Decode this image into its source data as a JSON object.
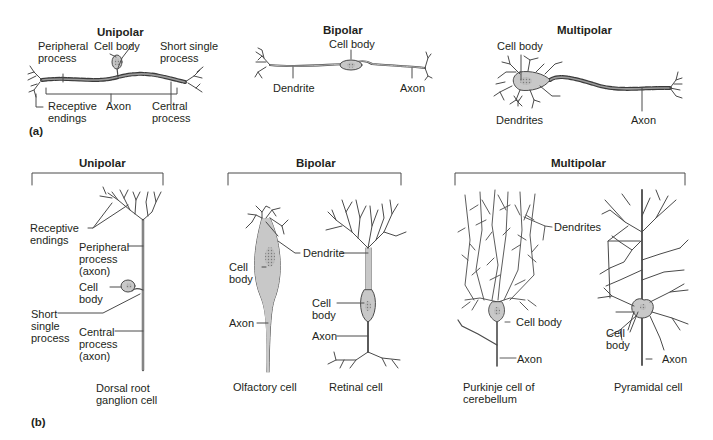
{
  "colors": {
    "line": "#4a4a4a",
    "cell_fill": "#c8c8c8",
    "nucleus": "#a9a9a9",
    "text": "#231f20",
    "background": "#ffffff"
  },
  "panel_a": {
    "label": "(a)",
    "unipolar": {
      "title": "Unipolar",
      "labels": {
        "peripheral_process": "Peripheral\nprocess",
        "cell_body": "Cell body",
        "short_single_process": "Short single\nprocess",
        "receptive_endings": "Receptive\nendings",
        "axon": "Axon",
        "central_process": "Central\nprocess"
      }
    },
    "bipolar": {
      "title": "Bipolar",
      "labels": {
        "cell_body": "Cell body",
        "dendrite": "Dendrite",
        "axon": "Axon"
      }
    },
    "multipolar": {
      "title": "Multipolar",
      "labels": {
        "cell_body": "Cell body",
        "dendrites": "Dendrites",
        "axon": "Axon"
      }
    }
  },
  "panel_b": {
    "label": "(b)",
    "unipolar": {
      "title": "Unipolar",
      "labels": {
        "receptive_endings": "Receptive\nendings",
        "peripheral_process": "Peripheral\nprocess\n(axon)",
        "cell_body": "Cell\nbody",
        "short_single_process": "Short\nsingle\nprocess",
        "central_process": "Central\nprocess\n(axon)"
      },
      "caption": "Dorsal root\nganglion cell"
    },
    "bipolar": {
      "title": "Bipolar",
      "labels": {
        "cell_body_olfactory": "Cell\nbody",
        "dendrite": "Dendrite",
        "axon_olfactory": "Axon",
        "cell_body_retinal": "Cell\nbody",
        "axon_retinal": "Axon"
      },
      "captions": {
        "olfactory": "Olfactory cell",
        "retinal": "Retinal cell"
      }
    },
    "multipolar": {
      "title": "Multipolar",
      "labels": {
        "dendrites": "Dendrites",
        "cell_body_purkinje": "Cell body",
        "axon_purkinje": "Axon",
        "cell_body_pyramidal": "Cell\nbody",
        "axon_pyramidal": "Axon"
      },
      "captions": {
        "purkinje": "Purkinje cell of\ncerebellum",
        "pyramidal": "Pyramidal cell"
      }
    }
  }
}
